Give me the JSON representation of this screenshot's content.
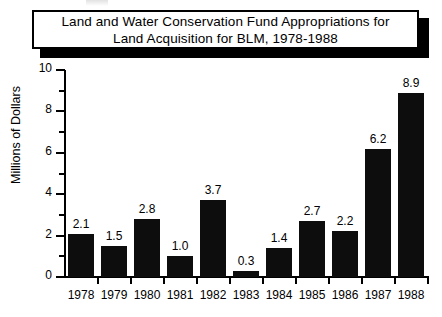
{
  "chart_data": {
    "type": "bar",
    "title": "Land and Water Conservation Fund Appropriations for Land Acquisition for BLM, 1978-1988",
    "title_lines": [
      "Land and Water Conservation Fund Appropriations for",
      "Land Acquisition for BLM, 1978-1988"
    ],
    "xlabel": "",
    "ylabel": "Millions of Dollars",
    "ylim": [
      0,
      10
    ],
    "ytick_labels": [
      "0",
      "2",
      "4",
      "6",
      "8",
      "10"
    ],
    "ytick_values": [
      0,
      2,
      4,
      6,
      8,
      10
    ],
    "yminor_values": [
      1,
      3,
      5,
      7,
      9
    ],
    "grid": false,
    "legend": null,
    "categories": [
      "1978",
      "1979",
      "1980",
      "1981",
      "1982",
      "1983",
      "1984",
      "1985",
      "1986",
      "1987",
      "1988"
    ],
    "values": [
      2.1,
      1.5,
      2.8,
      1.0,
      3.7,
      0.3,
      1.4,
      2.7,
      2.2,
      6.2,
      8.9
    ],
    "value_labels": [
      "2.1",
      "1.5",
      "2.8",
      "1.0",
      "3.7",
      "0.3",
      "1.4",
      "2.7",
      "2.2",
      "6.2",
      "8.9"
    ],
    "bar_color": "#0d0d0d",
    "axis_color": "#000000",
    "background_color": "#ffffff"
  }
}
